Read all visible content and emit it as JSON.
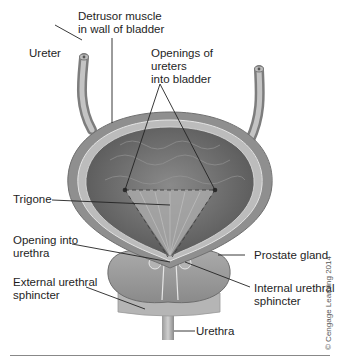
{
  "figure": {
    "labels": {
      "detrusor": "Detrusor muscle\nin wall of bladder",
      "ureter": "Ureter",
      "openings_ureters": "Openings of\nureters\ninto bladder",
      "trigone": "Trigone",
      "opening_urethra": "Opening into\nurethra",
      "prostate": "Prostate gland",
      "external_sphincter": "External urethral\nsphincter",
      "internal_sphincter": "Internal urethral\nsphincter",
      "urethra": "Urethra"
    },
    "credit": "© Cengage Learning 2014"
  },
  "colors": {
    "wall_outer": "#8e8e8e",
    "wall_band": "#b8b8b8",
    "lumen": "#6e6e6e",
    "trigone": "#a8a8a8",
    "prostate": "#9a9a9a",
    "leader_line": "#222222"
  }
}
